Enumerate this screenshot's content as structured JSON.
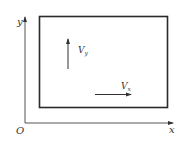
{
  "diagram": {
    "axes": {
      "origin_label": "O",
      "x_label": "x",
      "y_label": "y"
    },
    "vectors": {
      "vy": {
        "label": "V",
        "subscript": "y",
        "direction": "up"
      },
      "vx": {
        "label": "V",
        "subscript": "x",
        "direction": "right"
      }
    },
    "colors": {
      "line": "#333333",
      "box_border": "#2a2a2a",
      "background": "#ffffff"
    }
  }
}
